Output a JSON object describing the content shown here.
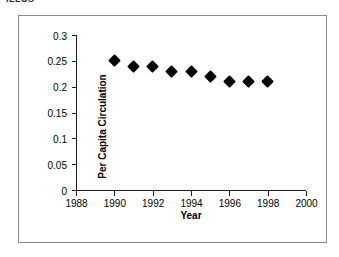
{
  "scan_fragment": "ILLUS",
  "chart_data": {
    "type": "scatter",
    "title": "",
    "xlabel": "Year",
    "ylabel": "Per Capita Circulation",
    "x": [
      1990,
      1991,
      1992,
      1993,
      1994,
      1995,
      1996,
      1997,
      1998
    ],
    "values": [
      0.25,
      0.24,
      0.24,
      0.23,
      0.23,
      0.22,
      0.21,
      0.21,
      0.21
    ],
    "xlim": [
      1988,
      2000
    ],
    "ylim": [
      0,
      0.3
    ],
    "xticks": [
      1988,
      1990,
      1992,
      1994,
      1996,
      1998,
      2000
    ],
    "xtick_labels": [
      "1988",
      "1990",
      "1992",
      "1994",
      "1996",
      "1998",
      "2000"
    ],
    "yticks": [
      0,
      0.05,
      0.1,
      0.15,
      0.2,
      0.25,
      0.3
    ],
    "ytick_labels": [
      "0",
      "0.05",
      "0.1",
      "0.15",
      "0.2",
      "0.25",
      "0.3"
    ],
    "grid": false,
    "legend": false,
    "marker": "diamond",
    "marker_color": "#000000",
    "axis_color": "#1a1a1a",
    "frame_color": "#8b8b8b",
    "background": "#ffffff"
  }
}
